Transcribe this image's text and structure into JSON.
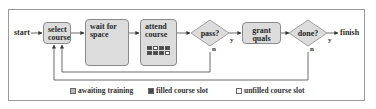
{
  "diagram": {
    "start_label": "start",
    "finish_label": "finish",
    "nodes": [
      {
        "id": "select_course",
        "type": "process",
        "label": "select\ncourse"
      },
      {
        "id": "wait_for_space",
        "type": "process",
        "label": "wait for\nspace"
      },
      {
        "id": "attend_course",
        "type": "process",
        "label": "attend\ncourse"
      },
      {
        "id": "pass",
        "type": "decision",
        "label": "pass?"
      },
      {
        "id": "grant_quals",
        "type": "process",
        "label": "grant\nquals"
      },
      {
        "id": "done",
        "type": "decision",
        "label": "done?"
      }
    ],
    "edges": [
      {
        "from": "start",
        "to": "select_course"
      },
      {
        "from": "select_course",
        "to": "wait_for_space"
      },
      {
        "from": "wait_for_space",
        "to": "attend_course"
      },
      {
        "from": "attend_course",
        "to": "pass"
      },
      {
        "from": "pass",
        "to": "grant_quals",
        "label": "y"
      },
      {
        "from": "pass",
        "to": "select_course",
        "label": "n"
      },
      {
        "from": "grant_quals",
        "to": "done"
      },
      {
        "from": "done",
        "to": "finish",
        "label": "y"
      },
      {
        "from": "done",
        "to": "select_course",
        "label": "n"
      }
    ],
    "branch_labels": {
      "yes": "y",
      "no": "n"
    },
    "attend_slots": [
      "filled",
      "empty",
      "filled",
      "filled",
      "filled",
      "filled",
      "filled",
      "empty"
    ]
  },
  "legend": {
    "items": [
      {
        "label": "awaiting training",
        "color": "#b8b8b8"
      },
      {
        "label": "filled course slot",
        "color": "#4a4a4a"
      },
      {
        "label": "unfilled course slot",
        "color": "#ffffff"
      }
    ]
  },
  "colors": {
    "node_fill": "#dcdcdc",
    "node_border": "#8a8a8a",
    "line": "#444444"
  }
}
